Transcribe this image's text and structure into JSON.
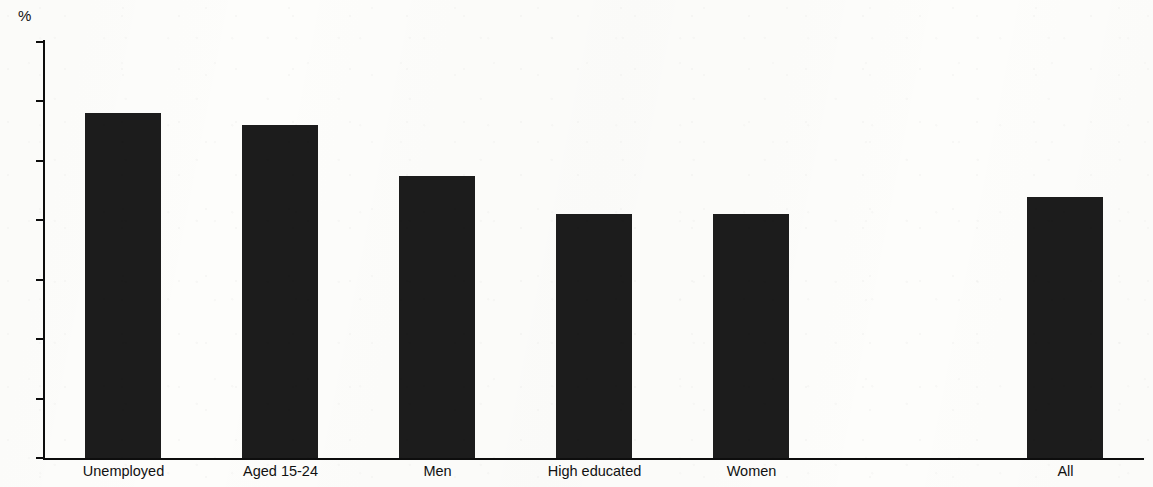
{
  "chart_data": {
    "type": "bar",
    "title": "",
    "subtitle": "",
    "xlabel": "",
    "ylabel": "%",
    "unit_label": "%",
    "ylim": [
      0,
      70
    ],
    "y_ticks": [
      0,
      10,
      20,
      30,
      40,
      50,
      60,
      70
    ],
    "y_tick_labels": [
      "0",
      "10",
      "20",
      "30",
      "40",
      "50",
      "60",
      "70"
    ],
    "grid": false,
    "legend": false,
    "legend_position": "none",
    "bar_color": "#1c1c1c",
    "background_color": "#fdfdfb",
    "axis_color": "#0d0d0d",
    "categories": [
      "Unemployed",
      "Aged 15-24",
      "Men",
      "High educated",
      "Women",
      "",
      "All"
    ],
    "values": [
      58,
      56,
      47.5,
      41,
      41,
      null,
      44
    ],
    "annotations": []
  }
}
